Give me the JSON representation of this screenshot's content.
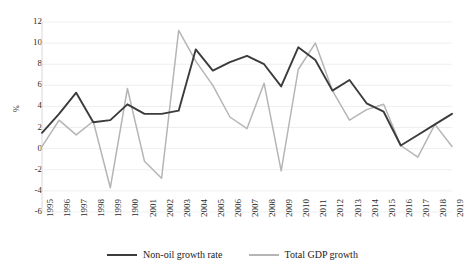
{
  "chart_data": {
    "type": "line",
    "title": "",
    "xlabel": "",
    "ylabel": "%",
    "ylim": [
      -6,
      12
    ],
    "ytick_step": 2,
    "yticks": [
      12,
      10,
      8,
      6,
      4,
      2,
      0,
      -2,
      -4,
      -6
    ],
    "grid": true,
    "grid_axis": "y",
    "legend_position": "bottom",
    "categories": [
      "1995",
      "1996",
      "1997",
      "1998",
      "1999",
      "1900",
      "2001",
      "2002",
      "2003",
      "2004",
      "2005",
      "2006",
      "2007",
      "2008",
      "2009",
      "2010",
      "2011",
      "2012",
      "2013",
      "2014",
      "2015",
      "2016",
      "2017",
      "2018",
      "2019"
    ],
    "x": [
      1995,
      1996,
      1997,
      1998,
      1999,
      2000,
      2001,
      2002,
      2003,
      2004,
      2005,
      2006,
      2007,
      2008,
      2009,
      2010,
      2011,
      2012,
      2013,
      2014,
      2015,
      2016,
      2017,
      2018,
      2019
    ],
    "series": [
      {
        "name": "Non-oil growth rate",
        "color": "#3b3b3b",
        "values": [
          1.5,
          3.3,
          5.3,
          2.5,
          2.7,
          4.2,
          3.3,
          3.3,
          3.6,
          9.4,
          7.4,
          8.2,
          8.8,
          8.0,
          5.9,
          9.6,
          8.4,
          5.5,
          6.5,
          4.3,
          3.5,
          0.3,
          1.3,
          2.3,
          3.3
        ]
      },
      {
        "name": "Total GDP growth",
        "color": "#b5b5b5",
        "values": [
          0.2,
          2.7,
          1.3,
          2.6,
          -3.7,
          5.7,
          -1.2,
          -2.8,
          11.2,
          8.3,
          6.0,
          3.0,
          1.9,
          6.2,
          -2.1,
          7.5,
          10.0,
          5.5,
          2.7,
          3.7,
          4.2,
          0.3,
          -0.8,
          2.3,
          0.2
        ]
      }
    ]
  },
  "legend": {
    "items": [
      {
        "label": "Non-oil growth rate",
        "color": "#3b3b3b"
      },
      {
        "label": "Total GDP growth",
        "color": "#b5b5b5"
      }
    ]
  },
  "axes": {
    "y_label": "%"
  }
}
